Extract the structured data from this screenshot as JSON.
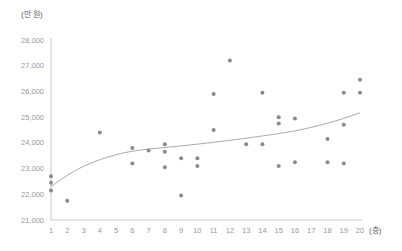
{
  "chart_data": {
    "type": "scatter",
    "title": "",
    "ylabel": "(만 원)",
    "xlabel": "(층)",
    "xlim": [
      1,
      20
    ],
    "ylim": [
      21000,
      28000
    ],
    "grid": false,
    "legend": null,
    "x_ticks": [
      "1",
      "2",
      "3",
      "4",
      "5",
      "6",
      "7",
      "8",
      "9",
      "10",
      "11",
      "12",
      "13",
      "14",
      "15",
      "16",
      "17",
      "18",
      "19",
      "20"
    ],
    "y_ticks": [
      "21,000",
      "22,000",
      "23,000",
      "24,000",
      "25,000",
      "26,000",
      "27,000",
      "28,000"
    ],
    "series": [
      {
        "name": "points",
        "type": "scatter",
        "points": [
          [
            1,
            22700
          ],
          [
            1,
            22450
          ],
          [
            1,
            22150
          ],
          [
            2,
            21750
          ],
          [
            4,
            24400
          ],
          [
            6,
            23800
          ],
          [
            6,
            23200
          ],
          [
            7,
            23700
          ],
          [
            8,
            23950
          ],
          [
            8,
            23650
          ],
          [
            8,
            23050
          ],
          [
            9,
            23400
          ],
          [
            9,
            21950
          ],
          [
            10,
            23400
          ],
          [
            10,
            23100
          ],
          [
            11,
            25900
          ],
          [
            11,
            24500
          ],
          [
            12,
            27200
          ],
          [
            13,
            23950
          ],
          [
            14,
            25950
          ],
          [
            14,
            23950
          ],
          [
            15,
            25000
          ],
          [
            15,
            24750
          ],
          [
            15,
            23100
          ],
          [
            16,
            24950
          ],
          [
            16,
            23250
          ],
          [
            18,
            24150
          ],
          [
            18,
            23250
          ],
          [
            19,
            25950
          ],
          [
            19,
            24700
          ],
          [
            19,
            23200
          ],
          [
            20,
            26450
          ],
          [
            20,
            25950
          ]
        ]
      },
      {
        "name": "trend",
        "type": "line",
        "points": [
          [
            1,
            22300
          ],
          [
            2,
            22750
          ],
          [
            3,
            23100
          ],
          [
            4,
            23350
          ],
          [
            5,
            23550
          ],
          [
            6,
            23680
          ],
          [
            7,
            23760
          ],
          [
            8,
            23820
          ],
          [
            9,
            23880
          ],
          [
            10,
            23950
          ],
          [
            11,
            24020
          ],
          [
            12,
            24100
          ],
          [
            13,
            24180
          ],
          [
            14,
            24270
          ],
          [
            15,
            24360
          ],
          [
            16,
            24460
          ],
          [
            17,
            24600
          ],
          [
            18,
            24760
          ],
          [
            19,
            24950
          ],
          [
            20,
            25170
          ]
        ]
      }
    ],
    "colors": {
      "points": "#8a8a8a",
      "trend": "#aaaaaa",
      "axis": "#c8c8c8",
      "tick_text": "#999999",
      "unit_text": "#666666"
    }
  }
}
